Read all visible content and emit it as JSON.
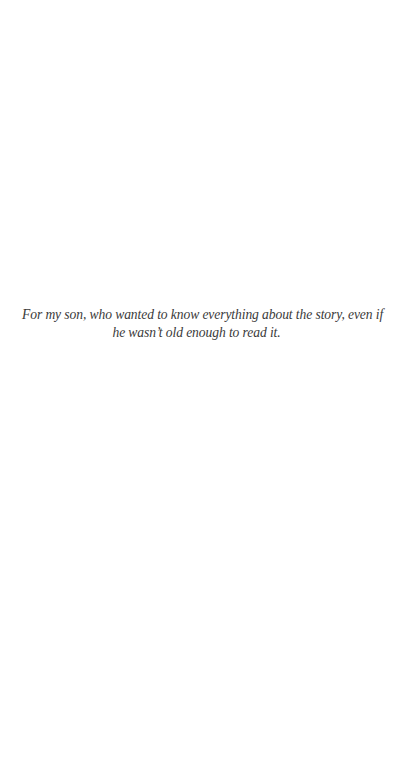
{
  "page": {
    "type": "dedication",
    "background_color": "#ffffff",
    "text_color": "#3a3a3a"
  },
  "dedication": {
    "lines": [
      "For my son, who wanted to know everything about the story, even if",
      "he wasn’t old enough to read it."
    ]
  }
}
